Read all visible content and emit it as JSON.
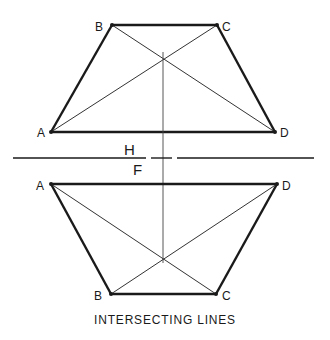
{
  "title": "INTERSECTING LINES",
  "fold_line": {
    "upper_label": "H",
    "lower_label": "F"
  },
  "top_view": {
    "points": {
      "A": {
        "label": "A",
        "x": 51,
        "y": 132
      },
      "B": {
        "label": "B",
        "x": 112,
        "y": 25
      },
      "C": {
        "label": "C",
        "x": 217,
        "y": 25
      },
      "D": {
        "label": "D",
        "x": 275,
        "y": 132
      }
    }
  },
  "front_view": {
    "points": {
      "A": {
        "label": "A",
        "x": 51,
        "y": 184
      },
      "B": {
        "label": "B",
        "x": 111,
        "y": 294
      },
      "C": {
        "label": "C",
        "x": 216,
        "y": 294
      },
      "D": {
        "label": "D",
        "x": 277,
        "y": 184
      }
    }
  },
  "colors": {
    "line": "#1a1a1a",
    "thin_line": "#333333"
  }
}
